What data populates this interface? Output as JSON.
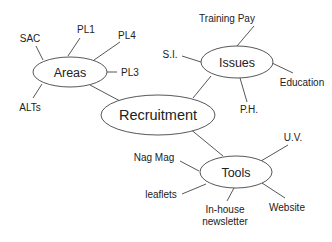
{
  "diagram": {
    "type": "mind-map",
    "center": {
      "id": "recruitment",
      "label": "Recruitment"
    },
    "hubs": [
      {
        "id": "areas",
        "label": "Areas",
        "children": [
          "SAC",
          "PL1",
          "PL4",
          "PL3",
          "ALTs"
        ]
      },
      {
        "id": "issues",
        "label": "Issues",
        "children": [
          "Training Pay",
          "S.I.",
          "Education",
          "P.H."
        ]
      },
      {
        "id": "tools",
        "label": "Tools",
        "children": [
          "U.V.",
          "Nag Mag",
          "leaflets",
          "In-house newsletter",
          "Website"
        ]
      }
    ],
    "labels": {
      "recruitment": "Recruitment",
      "areas": "Areas",
      "issues": "Issues",
      "tools": "Tools",
      "sac": "SAC",
      "pl1": "PL1",
      "pl4": "PL4",
      "pl3": "PL3",
      "alts": "ALTs",
      "training_pay": "Training Pay",
      "si": "S.I.",
      "education": "Education",
      "ph": "P.H.",
      "uv": "U.V.",
      "nag_mag": "Nag Mag",
      "leaflets": "leaflets",
      "inhouse_line1": "In-house",
      "inhouse_line2": "newsletter",
      "website": "Website"
    },
    "colors": {
      "stroke": "#444444",
      "text": "#222222",
      "background": "#ffffff"
    }
  }
}
